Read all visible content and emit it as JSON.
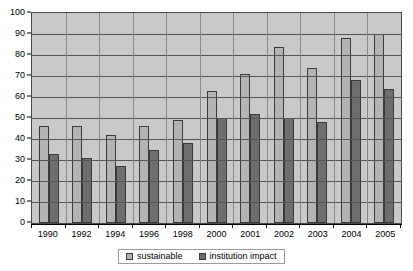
{
  "chart_data": {
    "type": "bar",
    "title": "",
    "subtitle": "",
    "xlabel": "",
    "ylabel": "",
    "ylim": [
      0,
      100
    ],
    "ytick_step": 10,
    "ytick_labels": [
      "0",
      "10",
      "20",
      "30",
      "40",
      "50",
      "60",
      "70",
      "80",
      "90",
      "100"
    ],
    "grid": "horizontal",
    "legend_position": "bottom",
    "categories": [
      "1990",
      "1992",
      "1994",
      "1996",
      "1998",
      "2000",
      "2001",
      "2002",
      "2003",
      "2004",
      "2005"
    ],
    "series": [
      {
        "name": "sustainable",
        "color": "#b3b3b3",
        "values": [
          46,
          46,
          42,
          46,
          49,
          63,
          71,
          84,
          74,
          88,
          90
        ]
      },
      {
        "name": "institution impact",
        "color": "#6e6e6e",
        "values": [
          33,
          31,
          27,
          35,
          38,
          50,
          52,
          50,
          48,
          68,
          64
        ]
      }
    ]
  },
  "legend": {
    "items": [
      {
        "label": "sustainable",
        "swatch": "legend-swatch-sustainable"
      },
      {
        "label": "institution impact",
        "swatch": "legend-swatch-institution-impact"
      }
    ]
  },
  "colors": {
    "plot_background": "#c9c9c9",
    "page_background": "#ffffff",
    "axis": "#000000",
    "gridline": "#555555",
    "series_sustainable": "#b3b3b3",
    "series_institution_impact": "#6e6e6e"
  }
}
